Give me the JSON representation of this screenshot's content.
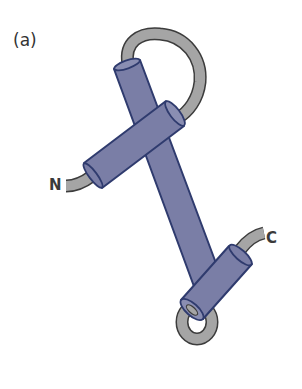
{
  "figure": {
    "panel_label": "(a)",
    "n_terminus_label": "N",
    "c_terminus_label": "C",
    "colors": {
      "helix_fill": "#7a7ea6",
      "helix_stroke": "#2f3b6e",
      "loop_fill": "#a5a5a5",
      "loop_stroke": "#3c3c3c",
      "background": "#ffffff"
    },
    "elements": [
      {
        "type": "helix",
        "id": "helix-1",
        "description": "long central helix"
      },
      {
        "type": "helix",
        "id": "helix-2",
        "description": "crossing helix near N-terminus"
      },
      {
        "type": "helix",
        "id": "helix-3",
        "description": "short helix near C-terminus"
      },
      {
        "type": "loop",
        "id": "top-loop"
      },
      {
        "type": "loop",
        "id": "bottom-loop"
      },
      {
        "type": "coil",
        "id": "n-terminal-tail"
      },
      {
        "type": "coil",
        "id": "c-terminal-tail"
      }
    ]
  }
}
